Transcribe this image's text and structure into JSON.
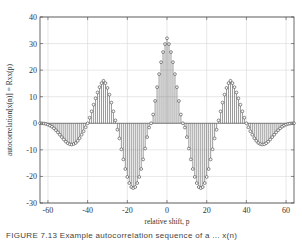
{
  "chart_data": {
    "type": "stem",
    "title": "",
    "xlabel": "relative shift, p",
    "ylabel": "autocorrelation[x(n)] = Rxx(p)",
    "xlim": [
      -64,
      64
    ],
    "ylim": [
      -30,
      40
    ],
    "xticks": [
      -60,
      -40,
      -20,
      0,
      20,
      40,
      60
    ],
    "yticks": [
      -30,
      -20,
      -10,
      0,
      10,
      20,
      30,
      40
    ],
    "xtick_labels": [
      "-60",
      "-40",
      "-20",
      "0",
      "20",
      "40",
      "60"
    ],
    "ytick_labels": [
      "-30",
      "-20",
      "-10",
      "0",
      "10",
      "20",
      "30",
      "40"
    ],
    "grid": true,
    "legend": null,
    "marker": "circle",
    "stem_color": "#555555",
    "marker_color": "#555555",
    "grid_color": "#d8d8d8",
    "annotations": [
      {
        "label": "central peak",
        "p": 0,
        "value": 32
      },
      {
        "label": "side peaks",
        "p": [
          -32,
          32
        ],
        "value": 16
      },
      {
        "label": "troughs",
        "p": [
          -16,
          16
        ],
        "value": -24
      },
      {
        "label": "outer troughs",
        "p": [
          -48,
          48
        ],
        "value": -8
      }
    ],
    "x": [
      -64,
      -63,
      -62,
      -61,
      -60,
      -59,
      -58,
      -57,
      -56,
      -55,
      -54,
      -53,
      -52,
      -51,
      -50,
      -49,
      -48,
      -47,
      -46,
      -45,
      -44,
      -43,
      -42,
      -41,
      -40,
      -39,
      -38,
      -37,
      -36,
      -35,
      -34,
      -33,
      -32,
      -31,
      -30,
      -29,
      -28,
      -27,
      -26,
      -25,
      -24,
      -23,
      -22,
      -21,
      -20,
      -19,
      -18,
      -17,
      -16,
      -15,
      -14,
      -13,
      -12,
      -11,
      -10,
      -9,
      -8,
      -7,
      -6,
      -5,
      -4,
      -3,
      -2,
      -1,
      0,
      1,
      2,
      3,
      4,
      5,
      6,
      7,
      8,
      9,
      10,
      11,
      12,
      13,
      14,
      15,
      16,
      17,
      18,
      19,
      20,
      21,
      22,
      23,
      24,
      25,
      26,
      27,
      28,
      29,
      30,
      31,
      32,
      33,
      34,
      35,
      36,
      37,
      38,
      39,
      40,
      41,
      42,
      43,
      44,
      45,
      46,
      47,
      48,
      49,
      50,
      51,
      52,
      53,
      54,
      55,
      56,
      57,
      58,
      59,
      60,
      61,
      62,
      63,
      64
    ],
    "values": [
      0,
      -0.02,
      -0.1,
      -0.25,
      -0.5,
      -0.85,
      -1.3,
      -1.9,
      -2.6,
      -3.4,
      -4.3,
      -5.2,
      -6.1,
      -6.9,
      -7.5,
      -7.9,
      -8.0,
      -7.8,
      -7.4,
      -6.6,
      -5.6,
      -4.3,
      -3.0,
      -1.5,
      0,
      2.1,
      4.5,
      7.0,
      9.4,
      11.6,
      13.6,
      15.1,
      16.0,
      15.1,
      13.3,
      10.8,
      7.8,
      4.5,
      1.1,
      -2.4,
      -5.7,
      -9.8,
      -13.6,
      -17.2,
      -20.2,
      -22.5,
      -24.0,
      -24.4,
      -24.0,
      -22.5,
      -20.2,
      -17.2,
      -13.6,
      -9.5,
      -5.2,
      -1.6,
      0,
      3.3,
      8.4,
      13.6,
      18.5,
      23.0,
      26.8,
      29.8,
      32.0,
      29.8,
      26.8,
      23.0,
      18.5,
      13.6,
      8.4,
      3.3,
      0,
      -1.6,
      -5.2,
      -9.5,
      -13.6,
      -17.2,
      -20.2,
      -22.5,
      -24.0,
      -24.4,
      -24.0,
      -22.5,
      -20.2,
      -17.2,
      -13.6,
      -9.8,
      -5.7,
      -2.4,
      1.1,
      4.5,
      7.8,
      10.8,
      13.3,
      15.1,
      16.0,
      15.1,
      13.6,
      11.6,
      9.4,
      7.0,
      4.5,
      2.1,
      0,
      -1.5,
      -3.0,
      -4.3,
      -5.6,
      -6.6,
      -7.4,
      -7.8,
      -8.0,
      -7.9,
      -7.5,
      -6.9,
      -6.1,
      -5.2,
      -4.3,
      -3.4,
      -2.6,
      -1.9,
      -1.3,
      -0.85,
      -0.5,
      -0.25,
      -0.1,
      -0.02,
      0
    ]
  },
  "caption": {
    "text": "FIGURE 7.13  Example autocorrelation sequence of a ... x(n)"
  }
}
